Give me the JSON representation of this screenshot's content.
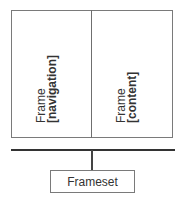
{
  "diagram": {
    "frames": [
      {
        "title": "Frame",
        "name": "[navigation]"
      },
      {
        "title": "Frame",
        "name": "[content]"
      }
    ],
    "frameset": {
      "label": "Frameset"
    },
    "colors": {
      "border": "#7a7a7a",
      "bus": "#333333",
      "text": "#333333"
    }
  }
}
